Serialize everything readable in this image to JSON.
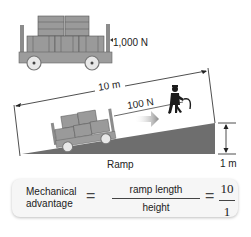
{
  "figure": {
    "top_cart": {
      "weight_label": "1,000 N"
    },
    "ramp": {
      "length_label": "10 m",
      "force_label": "100 N",
      "height_label": "1 m",
      "ramp_label": "Ramp",
      "ramp_color": "#6e6e6e"
    },
    "formula": {
      "lhs_line1": "Mechanical",
      "lhs_line2": "advantage",
      "equals": "=",
      "fraction_numerator": "ramp length",
      "fraction_denominator": "height",
      "result_numerator": "10",
      "result_denominator": "1"
    }
  }
}
